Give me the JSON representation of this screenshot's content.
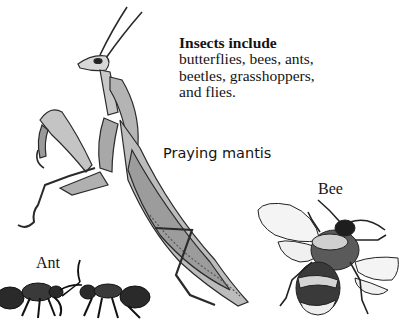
{
  "intro": {
    "title": "Insects include",
    "lines": [
      "butterflies, bees, ants,",
      "beetles, grasshoppers,",
      "and flies."
    ]
  },
  "labels": {
    "mantis": "Praying mantis",
    "bee": "Bee",
    "ant": "Ant"
  },
  "illustrations": [
    {
      "name": "praying-mantis-illustration",
      "subject": "Praying mantis"
    },
    {
      "name": "bee-illustration",
      "subject": "Bee"
    },
    {
      "name": "ant-illustration",
      "subject": "Ant",
      "count": 2
    }
  ],
  "colors": {
    "ink": "#141414",
    "body_grey": "#9a9a9a",
    "light_grey": "#cfcfcf",
    "dark": "#2a2a2a"
  }
}
